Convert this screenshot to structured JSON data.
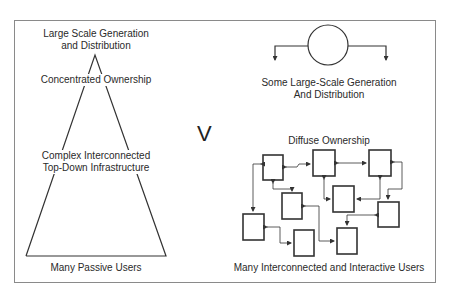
{
  "left_model": {
    "top_label_line1": "Large Scale Generation",
    "top_label_line2": "and Distribution",
    "ownership_label": "Concentrated Ownership",
    "infra_label_line1": "Complex Interconnected",
    "infra_label_line2": "Top-Down Infrastructure",
    "users_label": "Many Passive Users"
  },
  "versus": "V",
  "right_model": {
    "generation_label_line1": "Some Large-Scale Generation",
    "generation_label_line2": "And Distribution",
    "ownership_label": "Diffuse Ownership",
    "users_label": "Many Interconnected and Interactive Users",
    "node_count": 9
  },
  "colors": {
    "line": "#333333",
    "frame": "#8a8a8a",
    "text": "#2a2a2a"
  }
}
